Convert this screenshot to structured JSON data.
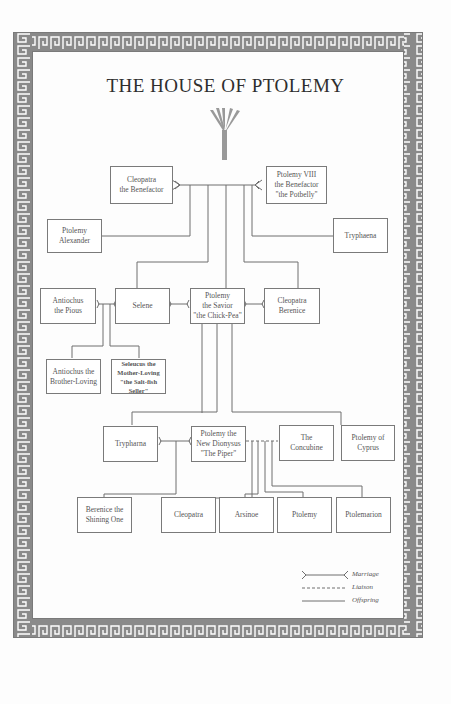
{
  "title": "THE HOUSE OF PTOLEMY",
  "colors": {
    "border": "#8a8a8a",
    "line": "#6e6e6e",
    "text": "#555555",
    "title": "#2e2e2e",
    "background": "#fdfdfd"
  },
  "icons": {
    "top": "papyrus-plant-icon"
  },
  "people": {
    "cleopatra_benefactor": "Cleopatra\nthe Benefactor",
    "ptolemy_viii": "Ptolemy VIII\nthe Benefactor\n\"the Potbelly\"",
    "ptolemy_alexander": "Ptolemy\nAlexander",
    "tryphaena_1": "Tryphaena",
    "antiochus_pious": "Antiochus\nthe Pious",
    "selene": "Selene",
    "ptolemy_savior": "Ptolemy\nthe Savior\n\"the Chick-Pea\"",
    "cleopatra_berenice": "Cleopatra\nBerenice",
    "antiochus_brother": "Antiochus the\nBrother-Loving",
    "seleucus": "Seleucus the\nMother-Loving\n\"the Salt-fish Seller\"",
    "tryphaena_2": "Trypharna",
    "ptolemy_piper": "Ptolemy the\nNew Dionysus\n\"The Piper\"",
    "concubine": "The\nConcubine",
    "ptolemy_cyprus": "Ptolemy of\nCyprus",
    "berenice_shining": "Berenice the\nShining One",
    "cleopatra": "Cleopatra",
    "arsinoe": "Arsinoe",
    "ptolemy": "Ptolemy",
    "ptolemarion": "Ptolemarion"
  },
  "legend": {
    "marriage": "Marriage",
    "liaison": "Liaison",
    "offspring": "Offspring"
  }
}
